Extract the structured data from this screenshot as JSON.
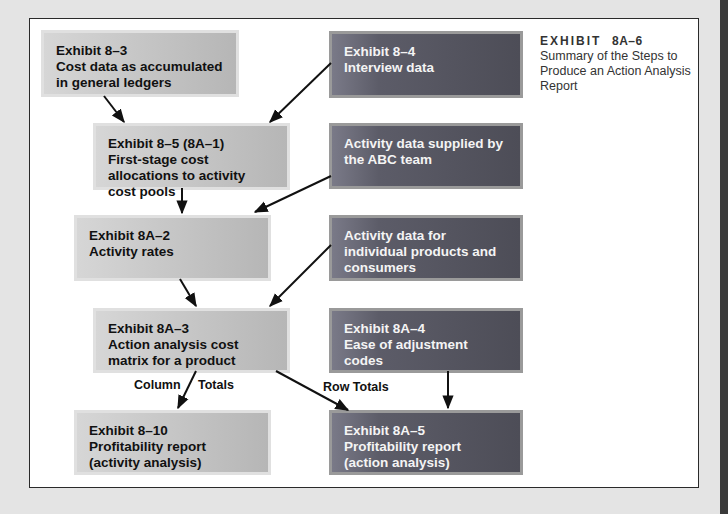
{
  "caption": {
    "exhibit_label": "EXHIBIT",
    "exhibit_number": "8A–6",
    "title": "Summary of the Steps to Produce an Action Analysis Report"
  },
  "nodes": {
    "cost_data": {
      "exhibit": "Exhibit 8–3",
      "text": "Cost data as accumulated in general ledgers",
      "style": "light"
    },
    "first_stage": {
      "exhibit": "Exhibit 8–5 (8A–1)",
      "text": "First-stage cost allocations to activity cost pools",
      "style": "light"
    },
    "activity_rates": {
      "exhibit": "Exhibit 8A–2",
      "text": "Activity rates",
      "style": "light"
    },
    "cost_matrix": {
      "exhibit": "Exhibit 8A–3",
      "text": "Action analysis cost matrix for a product",
      "style": "light"
    },
    "profit_activity": {
      "exhibit": "Exhibit 8–10",
      "text": "Profitability report (activity analysis)",
      "style": "light"
    },
    "interview": {
      "exhibit": "Exhibit 8–4",
      "text": "Interview data",
      "style": "dark"
    },
    "abc_team": {
      "exhibit": "",
      "text": "Activity data supplied by the ABC team",
      "style": "dark"
    },
    "individual": {
      "exhibit": "",
      "text": "Activity data for individual products and consumers",
      "style": "dark"
    },
    "ease_codes": {
      "exhibit": "Exhibit 8A–4",
      "text": "Ease of adjustment codes",
      "style": "dark"
    },
    "profit_action": {
      "exhibit": "Exhibit 8A–5",
      "text": "Profitability report (action analysis)",
      "style": "dark"
    }
  },
  "edge_labels": {
    "column": "Column",
    "totals": "Totals",
    "row_totals": "Row Totals"
  },
  "edges": [
    {
      "from": "cost_data",
      "to": "first_stage"
    },
    {
      "from": "interview",
      "to": "first_stage"
    },
    {
      "from": "first_stage",
      "to": "activity_rates"
    },
    {
      "from": "abc_team",
      "to": "activity_rates"
    },
    {
      "from": "activity_rates",
      "to": "cost_matrix"
    },
    {
      "from": "individual",
      "to": "cost_matrix"
    },
    {
      "from": "cost_matrix",
      "to": "profit_activity",
      "label": "Column Totals"
    },
    {
      "from": "cost_matrix",
      "to": "profit_action",
      "label": "Row Totals"
    },
    {
      "from": "ease_codes",
      "to": "profit_action"
    }
  ],
  "colors": {
    "light_box": "#c9c9c9",
    "dark_box": "#55555f",
    "arrow": "#111111",
    "frame_border": "#2a2a2a",
    "page_background": "#e4e4e4"
  }
}
